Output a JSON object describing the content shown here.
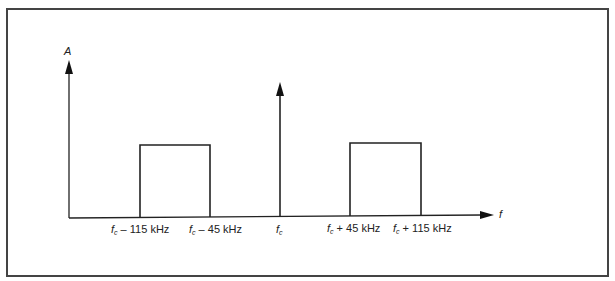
{
  "diagram": {
    "title": "",
    "y_axis_label": "A",
    "x_axis_label": "f",
    "tick_labels": [
      {
        "sym": "f",
        "sub": "c",
        "rest": " – 115 kHz"
      },
      {
        "sym": "f",
        "sub": "c",
        "rest": " – 45 kHz"
      },
      {
        "sym": "f",
        "sub": "c",
        "rest": ""
      },
      {
        "sym": "f",
        "sub": "c",
        "rest": " + 45 kHz"
      },
      {
        "sym": "f",
        "sub": "c",
        "rest": " + 115 kHz"
      }
    ],
    "components": [
      {
        "type": "band",
        "from": "fc - 115 kHz",
        "to": "fc - 45 kHz",
        "level": "sideband"
      },
      {
        "type": "carrier",
        "at": "fc",
        "level": "carrier"
      },
      {
        "type": "band",
        "from": "fc + 45 kHz",
        "to": "fc + 115 kHz",
        "level": "sideband"
      }
    ],
    "line_color": "#222222"
  }
}
